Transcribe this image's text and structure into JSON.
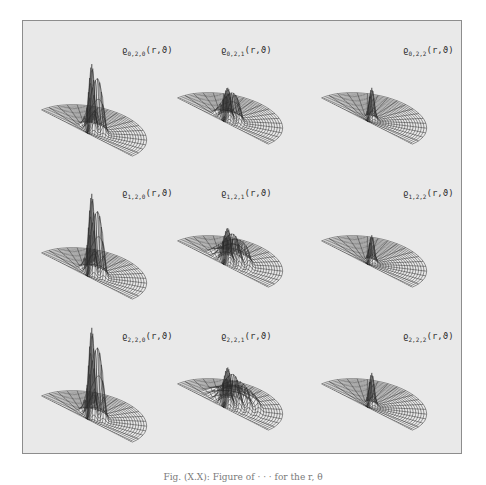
{
  "figure": {
    "caption": "Fig. (X.X): Figure of  ·  ·  ·  for the r, θ",
    "panels": [
      {
        "row": 0,
        "col": 0,
        "label_base": "ϱ",
        "label_sub": "0,2,0",
        "label_args": "(r,ϑ)",
        "peak_height": 0.75,
        "peak_spread": 2
      },
      {
        "row": 0,
        "col": 1,
        "label_base": "ϱ",
        "label_sub": "0,2,1",
        "label_args": "(r,ϑ)",
        "peak_height": 0.35,
        "peak_spread": 2
      },
      {
        "row": 0,
        "col": 2,
        "label_base": "ϱ",
        "label_sub": "0,2,2",
        "label_args": "(r,ϑ)",
        "peak_height": 0.35,
        "peak_spread": 1
      },
      {
        "row": 1,
        "col": 0,
        "label_base": "ϱ",
        "label_sub": "1,2,0",
        "label_args": "(r,ϑ)",
        "peak_height": 0.9,
        "peak_spread": 2
      },
      {
        "row": 1,
        "col": 1,
        "label_base": "ϱ",
        "label_sub": "1,2,1",
        "label_args": "(r,ϑ)",
        "peak_height": 0.38,
        "peak_spread": 3
      },
      {
        "row": 1,
        "col": 2,
        "label_base": "ϱ",
        "label_sub": "1,2,2",
        "label_args": "(r,ϑ)",
        "peak_height": 0.3,
        "peak_spread": 1
      },
      {
        "row": 2,
        "col": 0,
        "label_base": "ϱ",
        "label_sub": "2,2,0",
        "label_args": "(r,ϑ)",
        "peak_height": 1.0,
        "peak_spread": 2
      },
      {
        "row": 2,
        "col": 1,
        "label_base": "ϱ",
        "label_sub": "2,2,1",
        "label_args": "(r,ϑ)",
        "peak_height": 0.42,
        "peak_spread": 4
      },
      {
        "row": 2,
        "col": 2,
        "label_base": "ϱ",
        "label_sub": "2,2,2",
        "label_args": "(r,ϑ)",
        "peak_height": 0.36,
        "peak_spread": 1
      }
    ]
  },
  "colors": {
    "background": "#e9e9e9",
    "mesh": "#2a2a2a",
    "frame": "#8d8d8d"
  }
}
